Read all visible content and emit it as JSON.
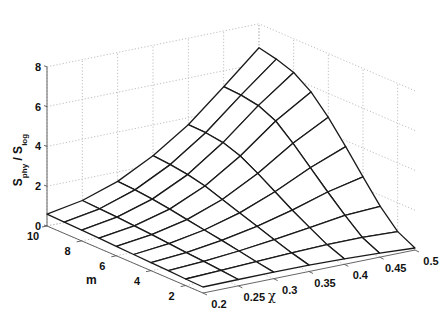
{
  "chart_data": {
    "type": "surface",
    "title": "",
    "xlabel": "χ",
    "ylabel": "m",
    "zlabel": "S_phy / S_log",
    "zlabel_parts": {
      "main1": "S",
      "sub1": "phy",
      "sep": " / ",
      "main2": "S",
      "sub2": "log"
    },
    "grid": true,
    "x_ticks": [
      "0.2",
      "0.25",
      "0.3",
      "0.35",
      "0.4",
      "0.45",
      "0.5"
    ],
    "x_values": [
      0.2,
      0.25,
      0.3,
      0.35,
      0.4,
      0.45,
      0.5
    ],
    "y_ticks": [
      "2",
      "4",
      "6",
      "8",
      "10"
    ],
    "y_values": [
      1,
      2,
      3,
      4,
      5,
      6,
      7,
      8,
      9,
      10
    ],
    "z_ticks": [
      "0",
      "2",
      "4",
      "6",
      "8"
    ],
    "xlim": [
      0.2,
      0.5
    ],
    "ylim": [
      1,
      10
    ],
    "zlim": [
      0,
      8
    ],
    "z_values_rows_by_m": [
      [
        0.3,
        0.32,
        0.33,
        0.32,
        0.28,
        0.2,
        0.1
      ],
      [
        0.33,
        0.4,
        0.48,
        0.56,
        0.62,
        0.62,
        0.55
      ],
      [
        0.37,
        0.48,
        0.64,
        0.85,
        1.1,
        1.35,
        1.45
      ],
      [
        0.4,
        0.55,
        0.8,
        1.15,
        1.6,
        2.15,
        2.55
      ],
      [
        0.44,
        0.62,
        0.95,
        1.45,
        2.15,
        3.0,
        3.7
      ],
      [
        0.47,
        0.7,
        1.1,
        1.75,
        2.7,
        3.85,
        4.8
      ],
      [
        0.51,
        0.77,
        1.25,
        2.05,
        3.2,
        4.6,
        5.7
      ],
      [
        0.54,
        0.83,
        1.38,
        2.25,
        3.5,
        5.0,
        6.3
      ],
      [
        0.57,
        0.88,
        1.47,
        2.38,
        3.62,
        5.15,
        6.6
      ],
      [
        0.6,
        0.92,
        1.52,
        2.45,
        3.65,
        5.2,
        6.8
      ]
    ]
  }
}
